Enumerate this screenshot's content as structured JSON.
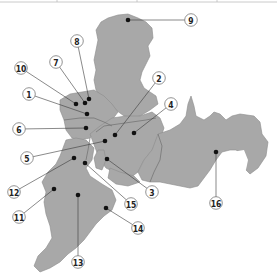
{
  "map": {
    "land_color": "#a8a8a8",
    "background_color": "#ffffff",
    "markers": [
      {
        "id": "1",
        "label": "1",
        "dot": [
          87,
          114
        ],
        "circle": [
          29,
          94
        ]
      },
      {
        "id": "2",
        "label": "2",
        "dot": [
          115,
          135
        ],
        "circle": [
          159,
          78
        ]
      },
      {
        "id": "3",
        "label": "3",
        "dot": [
          107,
          159
        ],
        "circle": [
          152,
          192
        ]
      },
      {
        "id": "4",
        "label": "4",
        "dot": [
          134,
          133
        ],
        "circle": [
          171,
          104
        ]
      },
      {
        "id": "5",
        "label": "5",
        "dot": [
          105,
          141
        ],
        "circle": [
          27,
          158
        ]
      },
      {
        "id": "6",
        "label": "6",
        "dot": [
          86,
          128
        ],
        "circle": [
          19,
          129
        ]
      },
      {
        "id": "7",
        "label": "7",
        "dot": [
          85,
          103
        ],
        "circle": [
          56,
          62
        ]
      },
      {
        "id": "8",
        "label": "8",
        "dot": [
          89,
          99
        ],
        "circle": [
          77,
          41
        ]
      },
      {
        "id": "9",
        "label": "9",
        "dot": [
          128,
          20
        ],
        "circle": [
          191,
          20
        ]
      },
      {
        "id": "10",
        "label": "10",
        "dot": [
          76,
          104
        ],
        "circle": [
          21,
          68
        ]
      },
      {
        "id": "11",
        "label": "11",
        "dot": [
          54,
          189
        ],
        "circle": [
          19,
          217
        ]
      },
      {
        "id": "12",
        "label": "12",
        "dot": [
          74,
          158
        ],
        "circle": [
          14,
          192
        ]
      },
      {
        "id": "13",
        "label": "13",
        "dot": [
          78,
          195
        ],
        "circle": [
          78,
          262
        ]
      },
      {
        "id": "14",
        "label": "14",
        "dot": [
          106,
          208
        ],
        "circle": [
          138,
          228
        ]
      },
      {
        "id": "15",
        "label": "15",
        "dot": [
          85,
          163
        ],
        "circle": [
          131,
          204
        ]
      },
      {
        "id": "16",
        "label": "16",
        "dot": [
          216,
          152
        ],
        "circle": [
          216,
          203
        ]
      }
    ]
  }
}
